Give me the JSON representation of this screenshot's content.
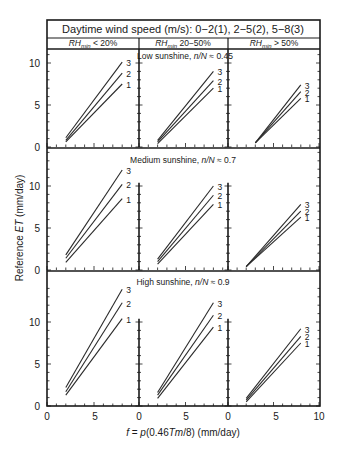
{
  "chart_data": {
    "type": "line",
    "title": "Daytime wind speed (m/s): 0−2(1), 2−5(2), 5−8(3)",
    "xlabel": "f = p(0.46Tm/8) (mm/day)",
    "ylabel": "Reference ET (mm/day)",
    "columns": [
      "RHmin < 20%",
      "RHmin 20−50%",
      "RHmin > 50%"
    ],
    "rows": [
      "Low sunshine, n/N ≈ 0.45",
      "Medium sunshine, n/N ≈ 0.7",
      "High sunshine, n/N ≈ 0.9"
    ],
    "x_ticks": [
      0,
      5
    ],
    "x_ticks_last": [
      0,
      5,
      10
    ],
    "y_ticks": [
      0,
      5,
      10
    ],
    "xlim": [
      0,
      10
    ],
    "ylim": [
      0,
      14
    ],
    "legend": [
      "1: wind 0−2 m/s",
      "2: wind 2−5 m/s",
      "3: wind 5−8 m/s"
    ],
    "panels": [
      {
        "row": 0,
        "col": 0,
        "series": [
          {
            "name": "1",
            "x": [
              2,
              8
            ],
            "y": [
              0.6,
              7.5
            ]
          },
          {
            "name": "2",
            "x": [
              2,
              8
            ],
            "y": [
              0.8,
              8.8
            ]
          },
          {
            "name": "3",
            "x": [
              2,
              8
            ],
            "y": [
              1.1,
              10.1
            ]
          }
        ]
      },
      {
        "row": 0,
        "col": 1,
        "series": [
          {
            "name": "1",
            "x": [
              2,
              8
            ],
            "y": [
              0.4,
              7.0
            ]
          },
          {
            "name": "2",
            "x": [
              2,
              8
            ],
            "y": [
              0.6,
              7.9
            ]
          },
          {
            "name": "3",
            "x": [
              2,
              8
            ],
            "y": [
              0.8,
              9.0
            ]
          }
        ]
      },
      {
        "row": 0,
        "col": 2,
        "series": [
          {
            "name": "1",
            "x": [
              3,
              8
            ],
            "y": [
              0.5,
              5.8
            ]
          },
          {
            "name": "2",
            "x": [
              3,
              8
            ],
            "y": [
              0.5,
              6.6
            ]
          },
          {
            "name": "3",
            "x": [
              3,
              8
            ],
            "y": [
              0.5,
              7.4
            ]
          }
        ]
      },
      {
        "row": 1,
        "col": 0,
        "series": [
          {
            "name": "1",
            "x": [
              2,
              8
            ],
            "y": [
              0.9,
              8.5
            ]
          },
          {
            "name": "2",
            "x": [
              2,
              8
            ],
            "y": [
              1.4,
              10.2
            ]
          },
          {
            "name": "3",
            "x": [
              2,
              8
            ],
            "y": [
              1.8,
              11.9
            ]
          }
        ]
      },
      {
        "row": 1,
        "col": 1,
        "series": [
          {
            "name": "1",
            "x": [
              2,
              8
            ],
            "y": [
              0.7,
              7.8
            ]
          },
          {
            "name": "2",
            "x": [
              2,
              8
            ],
            "y": [
              1.0,
              8.9
            ]
          },
          {
            "name": "3",
            "x": [
              2,
              8
            ],
            "y": [
              1.3,
              10.0
            ]
          }
        ]
      },
      {
        "row": 1,
        "col": 2,
        "series": [
          {
            "name": "1",
            "x": [
              2,
              8
            ],
            "y": [
              0.4,
              6.3
            ]
          },
          {
            "name": "2",
            "x": [
              2,
              8
            ],
            "y": [
              0.4,
              7.0
            ]
          },
          {
            "name": "3",
            "x": [
              2,
              8
            ],
            "y": [
              0.4,
              7.8
            ]
          }
        ]
      },
      {
        "row": 2,
        "col": 0,
        "series": [
          {
            "name": "1",
            "x": [
              2,
              8
            ],
            "y": [
              1.3,
              10.4
            ]
          },
          {
            "name": "2",
            "x": [
              2,
              8
            ],
            "y": [
              1.7,
              12.3
            ]
          },
          {
            "name": "3",
            "x": [
              2,
              8
            ],
            "y": [
              2.2,
              13.9
            ]
          }
        ]
      },
      {
        "row": 2,
        "col": 1,
        "series": [
          {
            "name": "1",
            "x": [
              2,
              8
            ],
            "y": [
              0.9,
              9.4
            ]
          },
          {
            "name": "2",
            "x": [
              2,
              8
            ],
            "y": [
              1.3,
              10.8
            ]
          },
          {
            "name": "3",
            "x": [
              2,
              8
            ],
            "y": [
              1.6,
              12.3
            ]
          }
        ]
      },
      {
        "row": 2,
        "col": 2,
        "series": [
          {
            "name": "1",
            "x": [
              2,
              8
            ],
            "y": [
              0.5,
              7.5
            ]
          },
          {
            "name": "2",
            "x": [
              2,
              8
            ],
            "y": [
              0.7,
              8.3
            ]
          },
          {
            "name": "3",
            "x": [
              2,
              8
            ],
            "y": [
              0.9,
              9.2
            ]
          }
        ]
      }
    ]
  },
  "labels": {
    "header": "Daytime wind speed (m/s): 0−2(1), 2−5(2), 5−8(3)",
    "col0_rh": "RH",
    "col0_sub": "min",
    "col0_rest": " < 20%",
    "col1_rh": "RH",
    "col1_sub": "min",
    "col1_rest": " 20−50%",
    "col2_rh": "RH",
    "col2_sub": "min",
    "col2_rest": " > 50%",
    "row0_title_a": "Low sunshine, ",
    "row0_title_b": "n/N",
    "row0_title_c": " ≈ 0.45",
    "row1_title_a": "Medium sunshine, ",
    "row1_title_b": "n/N",
    "row1_title_c": " ≈ 0.7",
    "row2_title_a": "High sunshine, ",
    "row2_title_b": "n/N",
    "row2_title_c": " ≈ 0.9",
    "ylabel_a": "Reference ",
    "ylabel_b": "ET",
    "ylabel_c": " (mm/day)",
    "xlabel_a": "f",
    "xlabel_b": " = ",
    "xlabel_c": "p",
    "xlabel_d": "(0.46",
    "xlabel_e": "Tm",
    "xlabel_f": "/8) (mm/day)",
    "series_labels": [
      "1",
      "2",
      "3"
    ],
    "y_tick_labels": [
      "0",
      "5",
      "10"
    ],
    "x_tick_labels": [
      "0",
      "5",
      "0",
      "5",
      "0",
      "5",
      "10"
    ]
  }
}
